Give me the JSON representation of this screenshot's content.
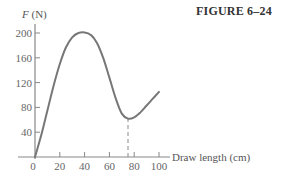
{
  "figure": {
    "title": "FIGURE 6–24"
  },
  "chart_data": {
    "type": "line",
    "title": "",
    "xlabel": "Draw length (cm)",
    "ylabel_var": "F",
    "ylabel_unit": "(N)",
    "xlim": [
      0,
      100
    ],
    "ylim": [
      0,
      200
    ],
    "x_ticks": [
      0,
      20,
      40,
      60,
      80,
      100
    ],
    "y_ticks": [
      40,
      80,
      120,
      160,
      200
    ],
    "grid": false,
    "legend": null,
    "series": [
      {
        "name": "F vs draw length",
        "x": [
          0,
          5,
          10,
          15,
          20,
          25,
          30,
          35,
          40,
          45,
          50,
          55,
          60,
          65,
          70,
          75,
          80,
          85,
          90,
          95,
          100
        ],
        "y": [
          0,
          35,
          75,
          115,
          150,
          177,
          193,
          200,
          201,
          197,
          184,
          160,
          128,
          95,
          70,
          62,
          64,
          72,
          83,
          94,
          105
        ]
      }
    ],
    "annotations": [
      {
        "type": "dashed-vertical",
        "x": 75,
        "y_from": 0,
        "y_to": 62,
        "note": "draw length at local minimum"
      }
    ]
  }
}
